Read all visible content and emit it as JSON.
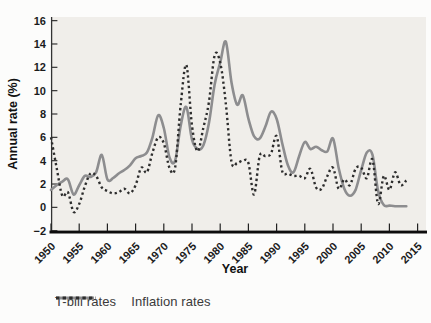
{
  "figure": {
    "y_axis_title": "Annual rate (%)",
    "x_axis_title": "Year",
    "legend": {
      "tbill_label": "T-bill rates",
      "inflation_label": "Inflation rates"
    },
    "colors": {
      "plot_background": "#f0eeea",
      "tbill_line": "#8d8d8f",
      "inflation_line": "#2d2d2d",
      "axis": "#333333",
      "x_axis_heavy": "#0d0d0d",
      "text": "#1b1b1b"
    }
  },
  "chart_data": {
    "type": "line",
    "title": "",
    "xlabel": "Year",
    "ylabel": "Annual rate (%)",
    "ylim": [
      -2,
      16
    ],
    "xlim": [
      1950,
      2016.5
    ],
    "y_ticks": [
      16,
      14,
      12,
      10,
      8,
      6,
      4,
      2,
      0,
      -2
    ],
    "x_ticks": [
      1950,
      1955,
      1960,
      1965,
      1970,
      1975,
      1980,
      1985,
      1990,
      1995,
      2000,
      2005,
      2010,
      2015
    ],
    "grid": false,
    "legend_position": "bottom",
    "x": [
      1950,
      1951,
      1952,
      1953,
      1954,
      1955,
      1956,
      1957,
      1958,
      1959,
      1960,
      1961,
      1962,
      1963,
      1964,
      1965,
      1966,
      1967,
      1968,
      1969,
      1970,
      1971,
      1972,
      1973,
      1974,
      1975,
      1976,
      1977,
      1978,
      1979,
      1980,
      1981,
      1982,
      1983,
      1984,
      1985,
      1986,
      1987,
      1988,
      1989,
      1990,
      1991,
      1992,
      1993,
      1994,
      1995,
      1996,
      1997,
      1998,
      1999,
      2000,
      2001,
      2002,
      2003,
      2004,
      2005,
      2006,
      2007,
      2008,
      2009,
      2010,
      2011,
      2012,
      2013
    ],
    "series": [
      {
        "name": "T-bill rates",
        "style": "solid",
        "color": "#8d8d8f",
        "values": [
          1.5,
          1.9,
          2.2,
          2.4,
          1.1,
          1.9,
          2.7,
          2.6,
          3.0,
          4.5,
          2.4,
          2.5,
          2.9,
          3.2,
          3.6,
          4.2,
          4.4,
          4.7,
          6.0,
          7.9,
          6.8,
          4.3,
          4.0,
          7.0,
          8.6,
          5.8,
          5.0,
          5.3,
          7.2,
          10.5,
          12.4,
          14.2,
          10.7,
          8.8,
          9.6,
          7.6,
          6.1,
          5.9,
          6.9,
          8.2,
          7.6,
          5.5,
          3.6,
          3.0,
          4.4,
          5.6,
          5.0,
          5.2,
          4.9,
          4.8,
          5.9,
          3.4,
          1.6,
          1.0,
          1.5,
          3.2,
          4.7,
          4.5,
          1.4,
          0.2,
          0.15,
          0.1,
          0.1,
          0.1
        ]
      },
      {
        "name": "Inflation rates",
        "style": "dotted",
        "color": "#2d2d2d",
        "values": [
          6.0,
          3.4,
          1.0,
          1.3,
          -0.4,
          0.3,
          1.8,
          2.9,
          2.7,
          1.7,
          1.4,
          1.2,
          1.3,
          1.6,
          1.2,
          1.9,
          3.4,
          3.0,
          4.7,
          6.0,
          5.5,
          3.4,
          3.4,
          8.8,
          12.2,
          7.0,
          4.8,
          6.8,
          9.0,
          13.0,
          12.4,
          8.9,
          3.9,
          3.8,
          4.0,
          3.8,
          1.1,
          4.4,
          4.4,
          4.6,
          6.1,
          3.1,
          2.9,
          2.7,
          2.7,
          2.5,
          3.3,
          1.7,
          1.6,
          2.7,
          3.4,
          1.6,
          2.4,
          1.9,
          3.3,
          3.4,
          2.5,
          4.1,
          0.3,
          2.7,
          1.5,
          3.0,
          1.9,
          2.3
        ]
      }
    ]
  }
}
